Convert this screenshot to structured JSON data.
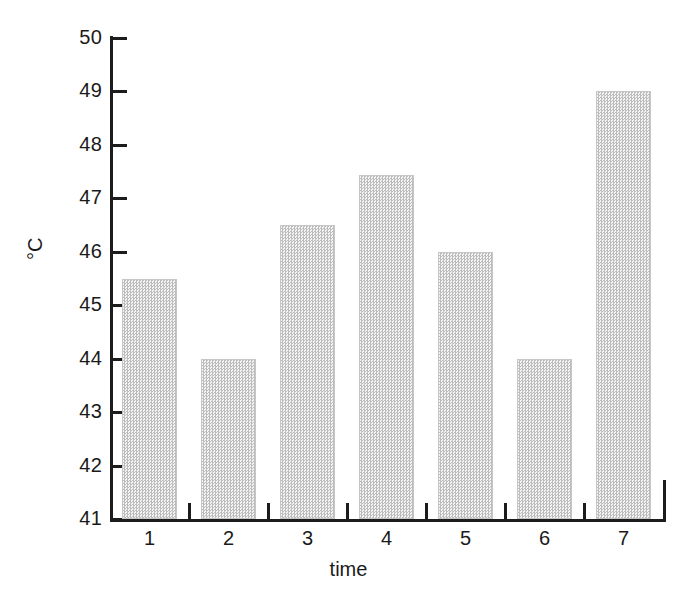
{
  "chart_data": {
    "type": "bar",
    "title": "",
    "subtitle": "",
    "xlabel": "time",
    "ylabel": "°C",
    "categories": [
      "1",
      "2",
      "3",
      "4",
      "5",
      "6",
      "7"
    ],
    "values": [
      45.5,
      44.0,
      46.5,
      47.43,
      46.0,
      44.0,
      49.0
    ],
    "ylim": [
      41,
      50
    ],
    "yticks": [
      41,
      42,
      43,
      44,
      45,
      46,
      47,
      48,
      49,
      50
    ],
    "ytick_labels": [
      "41",
      "42",
      "43",
      "44",
      "45",
      "46",
      "47",
      "48",
      "49",
      "50"
    ],
    "xtick_labels": [
      "1",
      "2",
      "3",
      "4",
      "5",
      "6",
      "7"
    ],
    "grid": false,
    "legend": null,
    "legend_position": "none",
    "bar_fill": "#e0e0e0",
    "bar_edge": "#c6c6c6",
    "axis_color": "#1c1c1c",
    "background": "#ffffff",
    "annotations": []
  },
  "axes": {
    "y_title": "°C",
    "x_title": "time"
  }
}
